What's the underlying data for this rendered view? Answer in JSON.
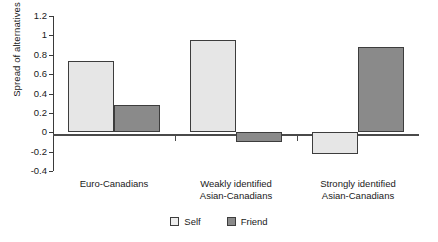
{
  "chart_data": {
    "type": "bar",
    "title": "",
    "xlabel": "",
    "ylabel": "Spread of alternatives",
    "categories": [
      "Euro-Canadians",
      "Weakly identified\nAsian-Canadians",
      "Strongly identified\nAsian-Canadians"
    ],
    "series": [
      {
        "name": "Self",
        "values": [
          0.74,
          0.95,
          -0.22
        ],
        "color": "#e6e6e6"
      },
      {
        "name": "Friend",
        "values": [
          0.28,
          -0.1,
          0.875
        ],
        "color": "#8a8a8a"
      }
    ],
    "ylim": [
      -0.4,
      1.2
    ],
    "yticks": [
      1.2,
      1,
      0.8,
      0.6,
      0.4,
      0.2,
      0,
      -0.2,
      -0.4
    ],
    "ytick_labels": [
      "1.2",
      "1",
      "0.8",
      "0.6",
      "0.4",
      "0.2",
      "0",
      "-0.2",
      "-0.4"
    ],
    "grid": false,
    "legend_position": "bottom"
  },
  "legend": {
    "items": [
      {
        "label": "Self"
      },
      {
        "label": "Friend"
      }
    ]
  }
}
